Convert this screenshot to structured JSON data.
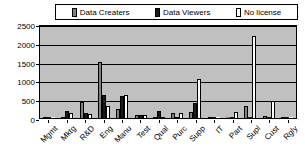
{
  "chart_data": {
    "type": "bar",
    "title": "",
    "xlabel": "",
    "ylabel": "",
    "ylim": [
      0,
      2500
    ],
    "ytick_step": 500,
    "grid": true,
    "legend_position": "top",
    "categories": [
      "Mgmt",
      "Mktg",
      "R&D",
      "Eng",
      "Manu",
      "Test",
      "Qual",
      "Purc",
      "Supp",
      "IT",
      "Part",
      "Supl",
      "Cust",
      "Rgly"
    ],
    "yticks": [
      "2500",
      "2000",
      "1500",
      "1000",
      "500",
      "0"
    ],
    "series": [
      {
        "name": "Data Creaters",
        "color": "#808080",
        "values": [
          40,
          30,
          420,
          1500,
          240,
          70,
          40,
          140,
          150,
          30,
          20,
          310,
          50,
          30
        ]
      },
      {
        "name": "Data Viewers",
        "color": "#1a1a1a",
        "values": [
          10,
          190,
          130,
          600,
          580,
          80,
          190,
          30,
          400,
          10,
          10,
          0,
          10,
          0
        ]
      },
      {
        "name": "No license",
        "color": "#ffffff",
        "values": [
          0,
          130,
          120,
          310,
          610,
          70,
          40,
          130,
          1040,
          20,
          160,
          2180,
          440,
          0
        ]
      }
    ]
  },
  "legend": {
    "entries": [
      {
        "label": "Data Creaters",
        "swatch": "swatch-data-creaters",
        "color": "#808080"
      },
      {
        "label": "Data Viewers",
        "swatch": "swatch-data-viewers",
        "color": "#1a1a1a"
      },
      {
        "label": "No license",
        "swatch": "swatch-no-license",
        "color": "#ffffff"
      }
    ]
  }
}
